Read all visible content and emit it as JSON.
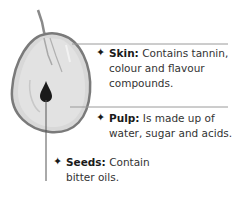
{
  "diagram": {
    "labels": [
      {
        "term": "Skin:",
        "description": "Contains tannin, colour and flavour compounds.",
        "lines": [
          "Contains tannin,",
          "colour and flavour",
          "compounds."
        ]
      },
      {
        "term": "Pulp:",
        "description": "Is made up of water, sugar and acids.",
        "lines": [
          "Is made up of",
          "water, sugar and acids."
        ]
      },
      {
        "term": "Seeds:",
        "description": "Contain bitter oils.",
        "lines": [
          "Contain",
          "bitter oils."
        ]
      }
    ],
    "bullet_glyph": "✦",
    "colors": {
      "leader_line": "#8a8a8a",
      "grape_fill": "#d6d6d6",
      "grape_outline": "#7a7a7a",
      "seed": "#1a1a1a"
    }
  }
}
